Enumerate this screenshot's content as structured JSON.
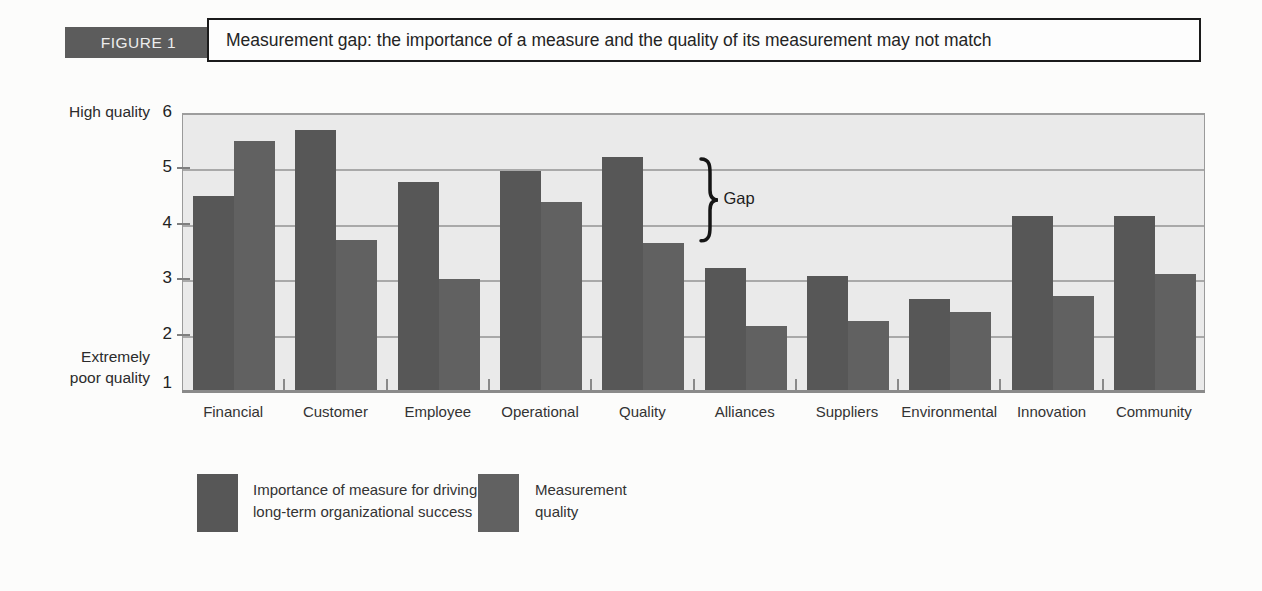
{
  "header": {
    "figure_label": "FIGURE 1",
    "title": "Measurement gap: the importance of a measure and the quality of its measurement may not match"
  },
  "colors": {
    "importance_bar": "#575757",
    "quality_bar": "#616161",
    "figure_tag_bg": "#5c5c5c",
    "plot_bg": "#eaeaea",
    "gridline": "#9d9d9d"
  },
  "chart_data": {
    "type": "bar",
    "title": "Measurement gap: the importance of a measure and the quality of its measurement may not match",
    "categories": [
      "Financial",
      "Customer",
      "Employee",
      "Operational",
      "Quality",
      "Alliances",
      "Suppliers",
      "Environmental",
      "Innovation",
      "Community"
    ],
    "series": [
      {
        "name": "Importance of measure for driving long-term organizational success",
        "values": [
          4.5,
          5.7,
          4.75,
          4.95,
          5.2,
          3.2,
          3.05,
          2.65,
          4.15,
          4.15
        ]
      },
      {
        "name": "Measurement quality",
        "values": [
          5.5,
          3.7,
          3.0,
          4.4,
          3.65,
          2.15,
          2.25,
          2.4,
          2.7,
          3.1
        ]
      }
    ],
    "ylim": [
      1,
      6
    ],
    "y_ticks": [
      6,
      5,
      4,
      3,
      2,
      1
    ],
    "y_axis_top_label": "High quality",
    "y_axis_bottom_label_lines": [
      "Extremely",
      "poor quality"
    ],
    "grid": "horizontal",
    "legend_position": "bottom",
    "annotation": {
      "label": "Gap",
      "category": "Quality",
      "from_value": 5.2,
      "to_value": 3.65
    }
  },
  "legend": {
    "items": [
      {
        "label_lines": [
          "Importance of measure for driving",
          "long-term organizational success"
        ],
        "hatched": false
      },
      {
        "label_lines": [
          "Measurement",
          "quality"
        ],
        "hatched": true
      }
    ]
  }
}
